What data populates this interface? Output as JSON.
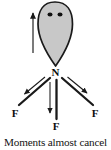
{
  "figure": {
    "caption": "Moments almost cancel",
    "background_color": "#ffffff"
  },
  "colors": {
    "lone_pair_fill": "#c8c8c8",
    "lone_pair_stroke": "#1a1a1a",
    "bond": "#1a1a1a",
    "arrow": "#1a1a1a",
    "text": "#121212"
  },
  "atoms": {
    "center": {
      "label": "N",
      "x": 55,
      "y": 72
    },
    "fluorines": [
      {
        "label": "F",
        "x": 15,
        "y": 113,
        "position": "left"
      },
      {
        "label": "F",
        "x": 55,
        "y": 126,
        "position": "center"
      },
      {
        "label": "F",
        "x": 94,
        "y": 113,
        "position": "right"
      }
    ]
  },
  "lone_pair": {
    "name": "lone-pair-lobe",
    "shape": "teardrop",
    "electron_dots": 2,
    "dot_positions": [
      {
        "x": 50,
        "y": 14
      },
      {
        "x": 60,
        "y": 14
      }
    ],
    "apex": {
      "x": 55,
      "y": 66
    },
    "top": {
      "x": 55,
      "y": 2
    },
    "half_width": 17
  },
  "dipole_arrows": [
    {
      "name": "lone-pair-dipole-arrow",
      "direction": "up",
      "x1": 33,
      "y1": 52,
      "x2": 33,
      "y2": 12
    },
    {
      "name": "left-bond-dipole-arrow",
      "direction": "down-left",
      "x1": 44,
      "y1": 78,
      "x2": 24,
      "y2": 95
    },
    {
      "name": "center-bond-dipole-arrow",
      "direction": "down",
      "x1": 50,
      "y1": 82,
      "x2": 50,
      "y2": 114
    },
    {
      "name": "right-bond-dipole-arrow",
      "direction": "down-right",
      "x1": 68,
      "y1": 78,
      "x2": 87,
      "y2": 94
    }
  ],
  "bonds": [
    {
      "name": "bond-n-f-left",
      "x1": 50,
      "y1": 78,
      "x2": 20,
      "y2": 104
    },
    {
      "name": "bond-n-f-center",
      "x1": 56,
      "y1": 80,
      "x2": 56,
      "y2": 118
    },
    {
      "name": "bond-n-f-right",
      "x1": 62,
      "y1": 78,
      "x2": 92,
      "y2": 104
    }
  ]
}
